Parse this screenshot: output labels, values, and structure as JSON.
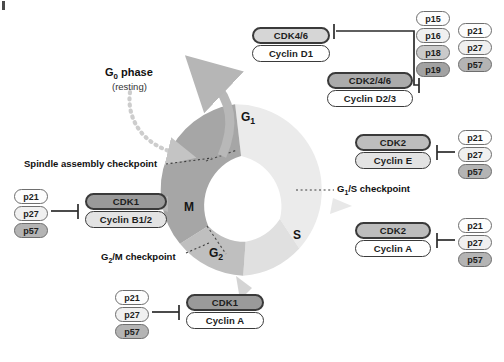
{
  "diagram": {
    "type": "cell-cycle-diagram",
    "background": "#ffffff"
  },
  "cycle": {
    "center_x": 250,
    "center_y": 190,
    "outer_radius": 86,
    "inner_radius": 52,
    "phases": [
      {
        "id": "G1",
        "label": "G",
        "sub": "1",
        "color": "#ebebeb",
        "label_x": 248,
        "label_y": 118
      },
      {
        "id": "S",
        "label": "S",
        "sub": "",
        "color": "#e2e2e2",
        "label_x": 297,
        "label_y": 236
      },
      {
        "id": "G2",
        "label": "G",
        "sub": "2",
        "color": "#bfbfbf",
        "label_x": 216,
        "label_y": 254
      },
      {
        "id": "M",
        "label": "M",
        "sub": "",
        "color": "#a6a6a6",
        "label_x": 190,
        "label_y": 209
      }
    ]
  },
  "g0": {
    "title": "G₀ phase",
    "title_plain": "G",
    "title_sub": "0",
    "title_rest": " phase",
    "subtitle": "(resting)",
    "exit_arrow_color": "#b6b6b6",
    "reentry_arrow_color": "#c9c9c9"
  },
  "checkpoints": [
    {
      "id": "spindle",
      "label": "Spindle assembly checkpoint",
      "x": 24,
      "y": 158
    },
    {
      "id": "g2m",
      "label_parts": {
        "a": "G",
        "sub": "2",
        "b": "/M checkpoint"
      },
      "label": "G2/M checkpoint",
      "x": 101,
      "y": 251
    },
    {
      "id": "g1s",
      "label_parts": {
        "a": "G",
        "sub": "1",
        "b": "/S checkpoint"
      },
      "label": "G1/S checkpoint",
      "x": 337,
      "y": 183
    }
  ],
  "complexes": [
    {
      "id": "cdk46-cyclind1",
      "cdk": "CDK4/6",
      "cdk_fill": "f-l2",
      "cyclin": "Cyclin D1",
      "cyclin_fill": "f-white",
      "x": 252,
      "y": 27,
      "w": 78
    },
    {
      "id": "cdk246-cyclind23",
      "cdk": "CDK2/4/6",
      "cdk_fill": "f-m2",
      "cyclin": "Cyclin D2/3",
      "cyclin_fill": "f-white",
      "x": 327,
      "y": 72,
      "w": 86
    },
    {
      "id": "cdk2-cycline",
      "cdk": "CDK2",
      "cdk_fill": "f-m1",
      "cyclin": "Cyclin E",
      "cyclin_fill": "f-l1",
      "x": 355,
      "y": 134,
      "w": 76
    },
    {
      "id": "cdk2-cyclina",
      "cdk": "CDK2",
      "cdk_fill": "f-m1",
      "cyclin": "Cyclin A",
      "cyclin_fill": "f-white",
      "x": 355,
      "y": 222,
      "w": 76
    },
    {
      "id": "cdk1-cyclinb",
      "cdk": "CDK1",
      "cdk_fill": "f-d1",
      "cyclin": "Cyclin B1/2",
      "cyclin_fill": "f-l1",
      "x": 85,
      "y": 193,
      "w": 82
    },
    {
      "id": "cdk1-cyclina",
      "cdk": "CDK1",
      "cdk_fill": "f-d1",
      "cyclin": "Cyclin A",
      "cyclin_fill": "f-white",
      "x": 186,
      "y": 294,
      "w": 78
    }
  ],
  "inhibitor_groups": [
    {
      "id": "ink4-group",
      "x": 416,
      "y": 11,
      "items": [
        {
          "label": "p15",
          "fill": "i-w"
        },
        {
          "label": "p16",
          "fill": "i-1"
        },
        {
          "label": "p18",
          "fill": "i-3"
        },
        {
          "label": "p19",
          "fill": "i-5"
        }
      ]
    },
    {
      "id": "cip-kip-top",
      "x": 458,
      "y": 23,
      "items": [
        {
          "label": "p21",
          "fill": "i-w"
        },
        {
          "label": "p27",
          "fill": "i-1"
        },
        {
          "label": "p57",
          "fill": "i-4"
        }
      ]
    },
    {
      "id": "cip-kip-cycline",
      "x": 458,
      "y": 130,
      "items": [
        {
          "label": "p21",
          "fill": "i-w"
        },
        {
          "label": "p27",
          "fill": "i-1"
        },
        {
          "label": "p57",
          "fill": "i-4"
        }
      ]
    },
    {
      "id": "cip-kip-cyclina",
      "x": 458,
      "y": 218,
      "items": [
        {
          "label": "p21",
          "fill": "i-w"
        },
        {
          "label": "p27",
          "fill": "i-1"
        },
        {
          "label": "p57",
          "fill": "i-4"
        }
      ]
    },
    {
      "id": "cip-kip-cyclinb",
      "x": 14,
      "y": 189,
      "items": [
        {
          "label": "p21",
          "fill": "i-w"
        },
        {
          "label": "p27",
          "fill": "i-1"
        },
        {
          "label": "p57",
          "fill": "i-4"
        }
      ]
    },
    {
      "id": "cip-kip-cdk1-cyclina",
      "x": 115,
      "y": 290,
      "items": [
        {
          "label": "p21",
          "fill": "i-w"
        },
        {
          "label": "p27",
          "fill": "i-1"
        },
        {
          "label": "p57",
          "fill": "i-4"
        }
      ]
    }
  ],
  "colors": {
    "line": "#2b2b2b",
    "pill_border": "#3a3a3a",
    "inhibitor_border": "#6e6e6e",
    "dotted": "#555555",
    "ring_g1": "#ebebeb",
    "ring_s": "#e2e2e2",
    "ring_g2": "#bfbfbf",
    "ring_m": "#a6a6a6"
  }
}
